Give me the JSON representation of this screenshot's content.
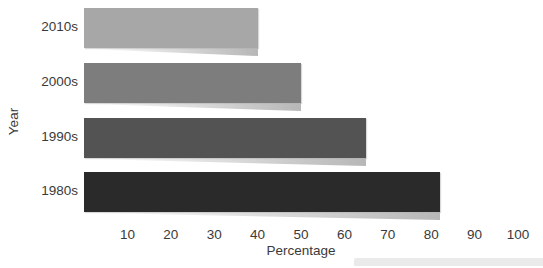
{
  "chart_data": {
    "type": "bar",
    "orientation": "horizontal",
    "title": "",
    "categories": [
      "2010s",
      "2000s",
      "1990s",
      "1980s"
    ],
    "values": [
      40,
      50,
      65,
      82
    ],
    "xlabel": "Percentage",
    "ylabel": "Year",
    "xticks": [
      10,
      20,
      30,
      40,
      50,
      60,
      70,
      80,
      90,
      100
    ],
    "xlim": [
      0,
      105
    ],
    "grid": false,
    "legend": false,
    "bar_colors": [
      "#a7a7a7",
      "#7d7d7d",
      "#535353",
      "#2a2a2a"
    ],
    "text_color": "#3a3a3a",
    "background_color": "#ffffff"
  }
}
